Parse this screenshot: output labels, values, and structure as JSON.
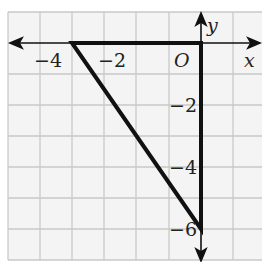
{
  "diagram": {
    "type": "coordinate-plane-triangle",
    "axes": {
      "x_label": "x",
      "y_label": "y",
      "origin_label": "O",
      "x_tick_labels": [
        {
          "value": -4,
          "text": "−4"
        },
        {
          "value": -2,
          "text": "−2"
        }
      ],
      "y_tick_labels": [
        {
          "value": -2,
          "text": "−2"
        },
        {
          "value": -4,
          "text": "−4"
        },
        {
          "value": -6,
          "text": "−6"
        }
      ],
      "grid_unit": 1,
      "x_range": [
        -6,
        1
      ],
      "y_range": [
        -7,
        1
      ]
    },
    "triangle": {
      "vertices": [
        {
          "x": -4,
          "y": 0
        },
        {
          "x": 0,
          "y": 0
        },
        {
          "x": 0,
          "y": -6
        }
      ],
      "stroke_color": "#111111"
    },
    "colors": {
      "grid": "#c8c8c8",
      "background": "#f2f2f2",
      "axis": "#111111"
    }
  }
}
